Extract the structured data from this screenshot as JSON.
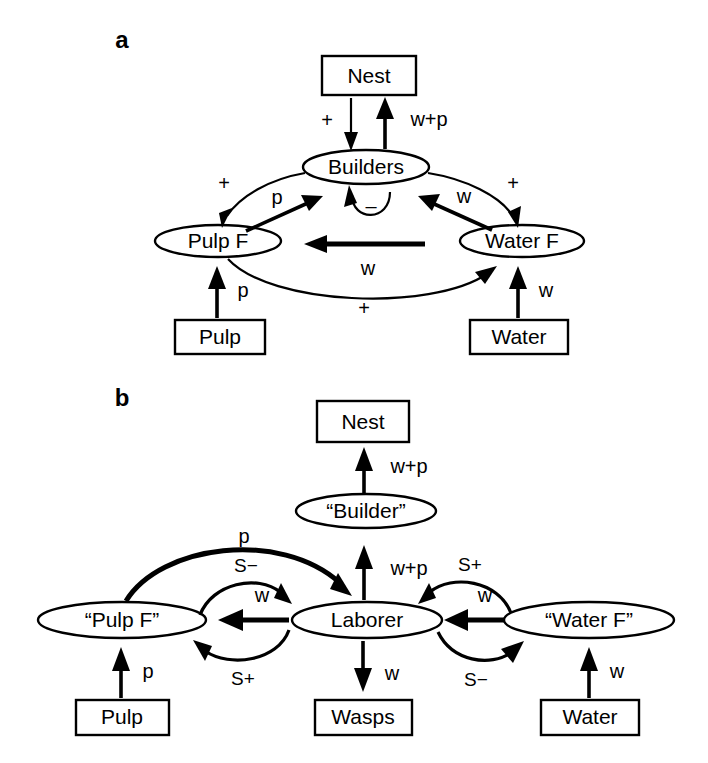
{
  "figure": {
    "background": "#ffffff",
    "stroke_color": "#000000",
    "panels": [
      {
        "letter": "a",
        "nodes": [
          {
            "id": "a-nest",
            "label": "Nest",
            "shape": "box"
          },
          {
            "id": "a-builders",
            "label": "Builders",
            "shape": "ellipse"
          },
          {
            "id": "a-pulpf",
            "label": "Pulp F",
            "shape": "ellipse"
          },
          {
            "id": "a-waterf",
            "label": "Water F",
            "shape": "ellipse"
          },
          {
            "id": "a-pulp",
            "label": "Pulp",
            "shape": "box"
          },
          {
            "id": "a-water",
            "label": "Water",
            "shape": "box"
          }
        ],
        "edges": [
          {
            "id": "a-e1",
            "from": "a-nest",
            "to": "a-builders",
            "label": "+"
          },
          {
            "id": "a-e2",
            "from": "a-builders",
            "to": "a-nest",
            "label": "w+p"
          },
          {
            "id": "a-e3",
            "from": "a-builders",
            "to": "a-pulpf",
            "label": "+"
          },
          {
            "id": "a-e4",
            "from": "a-pulpf",
            "to": "a-builders",
            "label": "p"
          },
          {
            "id": "a-e5",
            "from": "a-builders",
            "to": "a-builders",
            "label": "–"
          },
          {
            "id": "a-e6",
            "from": "a-waterf",
            "to": "a-builders",
            "label": "w"
          },
          {
            "id": "a-e7",
            "from": "a-builders",
            "to": "a-waterf",
            "label": "+"
          },
          {
            "id": "a-e8",
            "from": "a-waterf",
            "to": "a-pulpf",
            "label": "w"
          },
          {
            "id": "a-e9",
            "from": "a-pulpf",
            "to": "a-waterf",
            "label": "+"
          },
          {
            "id": "a-e10",
            "from": "a-pulp",
            "to": "a-pulpf",
            "label": "p"
          },
          {
            "id": "a-e11",
            "from": "a-water",
            "to": "a-waterf",
            "label": "w"
          }
        ]
      },
      {
        "letter": "b",
        "nodes": [
          {
            "id": "b-nest",
            "label": "Nest",
            "shape": "box"
          },
          {
            "id": "b-builder",
            "label": "“Builder”",
            "shape": "ellipse"
          },
          {
            "id": "b-laborer",
            "label": "Laborer",
            "shape": "ellipse"
          },
          {
            "id": "b-pulpf",
            "label": "“Pulp F”",
            "shape": "ellipse"
          },
          {
            "id": "b-waterf",
            "label": "“Water F”",
            "shape": "ellipse"
          },
          {
            "id": "b-pulp",
            "label": "Pulp",
            "shape": "box"
          },
          {
            "id": "b-wasps",
            "label": "Wasps",
            "shape": "box"
          },
          {
            "id": "b-water",
            "label": "Water",
            "shape": "box"
          }
        ],
        "edges": [
          {
            "id": "b-e1",
            "from": "b-builder",
            "to": "b-nest",
            "label": "w+p"
          },
          {
            "id": "b-e2",
            "from": "b-laborer",
            "to": "b-builder",
            "label": "w+p"
          },
          {
            "id": "b-e3",
            "from": "b-pulpf",
            "to": "b-laborer",
            "label": "p"
          },
          {
            "id": "b-e4",
            "from": "b-pulpf",
            "to": "b-laborer",
            "label": "S−"
          },
          {
            "id": "b-e5",
            "from": "b-laborer",
            "to": "b-pulpf",
            "label": "w"
          },
          {
            "id": "b-e6",
            "from": "b-laborer",
            "to": "b-pulpf",
            "label": "S+"
          },
          {
            "id": "b-e7",
            "from": "b-waterf",
            "to": "b-laborer",
            "label": "S+"
          },
          {
            "id": "b-e8",
            "from": "b-waterf",
            "to": "b-laborer",
            "label": "w"
          },
          {
            "id": "b-e9",
            "from": "b-laborer",
            "to": "b-waterf",
            "label": "S−"
          },
          {
            "id": "b-e10",
            "from": "b-laborer",
            "to": "b-wasps",
            "label": "w"
          },
          {
            "id": "b-e11",
            "from": "b-pulp",
            "to": "b-pulpf",
            "label": "p"
          },
          {
            "id": "b-e12",
            "from": "b-water",
            "to": "b-waterf",
            "label": "w"
          }
        ]
      }
    ]
  },
  "panel_a": {
    "letter": "a",
    "nest": "Nest",
    "builders": "Builders",
    "pulp_f": "Pulp F",
    "water_f": "Water F",
    "pulp": "Pulp",
    "water": "Water",
    "lbl_nest_to_builders": "+",
    "lbl_builders_to_nest": "w+p",
    "lbl_builders_to_pulpf": "+",
    "lbl_pulpf_to_builders": "p",
    "lbl_self_inhibit": "–",
    "lbl_waterf_to_builders": "w",
    "lbl_builders_to_waterf": "+",
    "lbl_waterf_to_pulpf": "w",
    "lbl_pulpf_to_waterf": "+",
    "lbl_pulp_to_pulpf": "p",
    "lbl_water_to_waterf": "w"
  },
  "panel_b": {
    "letter": "b",
    "nest": "Nest",
    "builder": "“Builder”",
    "laborer": "Laborer",
    "pulp_f": "“Pulp F”",
    "water_f": "“Water F”",
    "pulp": "Pulp",
    "wasps": "Wasps",
    "water": "Water",
    "lbl_builder_to_nest": "w+p",
    "lbl_laborer_to_builder": "w+p",
    "lbl_pulpf_to_laborer_p": "p",
    "lbl_pulpf_to_laborer_s": "S−",
    "lbl_laborer_to_pulpf_w": "w",
    "lbl_laborer_to_pulpf_s": "S+",
    "lbl_waterf_to_laborer_s": "S+",
    "lbl_waterf_to_laborer_w": "w",
    "lbl_laborer_to_waterf_s": "S−",
    "lbl_laborer_to_wasps": "w",
    "lbl_pulp_to_pulpf": "p",
    "lbl_water_to_waterf": "w"
  }
}
